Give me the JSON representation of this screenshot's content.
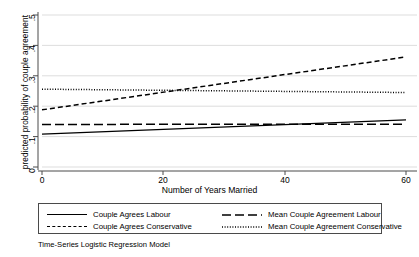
{
  "chart_data": {
    "type": "line",
    "title": "",
    "subtitle": "",
    "caption": "Time-Series Logistic Regression Model",
    "xlabel": "Number of Years Married",
    "ylabel": "predicted probability of couple agreement",
    "xlim": [
      0,
      62
    ],
    "ylim": [
      0,
      0.52
    ],
    "xticks": [
      0,
      20,
      40,
      60
    ],
    "xticklabels": [
      "0",
      "20",
      "40",
      "60"
    ],
    "yticks": [
      0,
      0.1,
      0.2,
      0.3,
      0.4,
      0.5
    ],
    "yticklabels": [
      "0",
      ".1",
      ".2",
      ".3",
      ".4",
      ".5"
    ],
    "grid": "horizontal",
    "grid_color": "#d9d9d9",
    "legend_position": "below-axes",
    "x": [
      0,
      60
    ],
    "series": [
      {
        "name": "Couple Agrees Labour",
        "style": "solid",
        "color": "#000000",
        "values": [
          0.108,
          0.155
        ]
      },
      {
        "name": "Couple Agrees Conservative",
        "style": "dashed",
        "color": "#000000",
        "values": [
          0.188,
          0.362
        ]
      },
      {
        "name": "Mean Couple Agreement Labour",
        "style": "long-dashed",
        "color": "#000000",
        "values": [
          0.14,
          0.141
        ]
      },
      {
        "name": "Mean Couple Agreement Conservative",
        "style": "dotted",
        "color": "#000000",
        "values": [
          0.256,
          0.245
        ]
      }
    ]
  },
  "axis": {
    "y_title": "predicted probability of couple agreement",
    "x_title": "Number of Years Married",
    "y_tick_labels": [
      "0",
      ".1",
      ".2",
      ".3",
      ".4",
      ".5"
    ],
    "x_tick_labels": [
      "0",
      "20",
      "40",
      "60"
    ]
  },
  "legend": {
    "entries": [
      {
        "label": "Couple Agrees Labour",
        "key": "solid"
      },
      {
        "label": "Couple Agrees Conservative",
        "key": "dashed"
      },
      {
        "label": "Mean Couple Agreement Labour",
        "key": "long-dashed"
      },
      {
        "label": "Mean Couple Agreement Conservative",
        "key": "dotted"
      }
    ]
  },
  "caption": "Time-Series Logistic Regression Model"
}
